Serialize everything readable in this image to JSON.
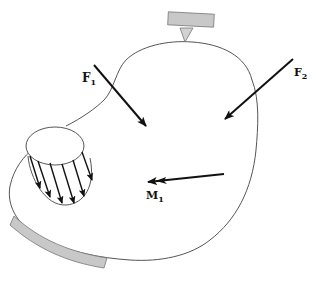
{
  "diagram": {
    "type": "mechanics free-body sketch",
    "colors": {
      "background": "#ffffff",
      "outline": "#555555",
      "arrow": "#111111",
      "support_fill": "#c8c8c8",
      "support_stroke": "#777777"
    },
    "labels": {
      "f1": "F",
      "f1_sub": "1",
      "f2": "F",
      "f2_sub": "2",
      "m1": "M",
      "m1_sub": "1"
    },
    "elements": [
      {
        "id": "body",
        "kind": "irregular closed curve body"
      },
      {
        "id": "top-support",
        "kind": "point support (pin/knife-edge) on rectangular block"
      },
      {
        "id": "bottom-support",
        "kind": "curved distributed support strip"
      },
      {
        "id": "distributed-load",
        "kind": "cylinder with 6 parallel downward arrows"
      },
      {
        "id": "force-f1",
        "kind": "force arrow",
        "label": "F1"
      },
      {
        "id": "force-f2",
        "kind": "force arrow",
        "label": "F2"
      },
      {
        "id": "moment-m1",
        "kind": "double-headed moment vector",
        "label": "M1"
      }
    ]
  }
}
